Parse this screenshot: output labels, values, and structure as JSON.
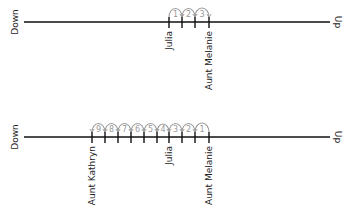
{
  "diagram_1": {
    "left_label": "Down",
    "right_label": "Up",
    "line_y": 22,
    "line_x1": 24,
    "line_x2": 330,
    "ticks": [
      169,
      182,
      195,
      209
    ],
    "tick_labels": [
      {
        "x": 169,
        "text": "Julia"
      },
      {
        "x": 209,
        "text": "Aunt Melanie"
      }
    ],
    "jumps": [
      {
        "from": 169,
        "to": 182,
        "label": "1"
      },
      {
        "from": 182,
        "to": 195,
        "label": "2"
      },
      {
        "from": 195,
        "to": 209,
        "label": "3"
      }
    ],
    "direction": "right"
  },
  "diagram_2": {
    "left_label": "Down",
    "right_label": "Up",
    "line_y": 137,
    "line_x1": 24,
    "line_x2": 330,
    "ticks": [
      92,
      105,
      118,
      131,
      144,
      157,
      169,
      182,
      195,
      209
    ],
    "tick_labels": [
      {
        "x": 92,
        "text": "Aunt Kathryn"
      },
      {
        "x": 169,
        "text": "Julia"
      },
      {
        "x": 209,
        "text": "Aunt Melanie"
      }
    ],
    "jumps": [
      {
        "from": 209,
        "to": 195,
        "label": "1"
      },
      {
        "from": 195,
        "to": 182,
        "label": "2"
      },
      {
        "from": 182,
        "to": 169,
        "label": "3"
      },
      {
        "from": 169,
        "to": 157,
        "label": "4"
      },
      {
        "from": 157,
        "to": 144,
        "label": "5"
      },
      {
        "from": 144,
        "to": 131,
        "label": "6"
      },
      {
        "from": 131,
        "to": 118,
        "label": "7"
      },
      {
        "from": 118,
        "to": 105,
        "label": "8"
      },
      {
        "from": 105,
        "to": 92,
        "label": "9"
      }
    ],
    "direction": "left"
  },
  "colors": {
    "axis": "#111111",
    "arc": "#999999",
    "label": "#222222"
  }
}
